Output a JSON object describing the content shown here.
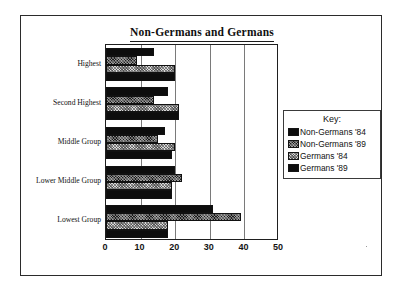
{
  "chart_data": {
    "type": "bar",
    "orientation": "horizontal",
    "title": "Non-Germans and Germans",
    "xlabel": "",
    "ylabel": "",
    "xlim": [
      0,
      50
    ],
    "xticks": [
      0,
      10,
      20,
      30,
      40,
      50
    ],
    "grid": "vertical",
    "legend_position": "right",
    "legend_title": "Key:",
    "categories": [
      "Highest",
      "Second Highest",
      "Middle Group",
      "Lower Middle Group",
      "Lowest Group"
    ],
    "series": [
      {
        "name": "Non-Germans '84",
        "swatch": "solid-black",
        "color": "#0d0d0d",
        "values": [
          14,
          18,
          17,
          20,
          31
        ]
      },
      {
        "name": "Non-Germans '89",
        "swatch": "dark-hatch",
        "color": "#1c1c1c",
        "values": [
          9,
          14,
          15,
          22,
          39
        ]
      },
      {
        "name": "Germans '84",
        "swatch": "light-check",
        "color": "#d9d9d9",
        "values": [
          20,
          21,
          20,
          19,
          18
        ]
      },
      {
        "name": "Germans '89",
        "swatch": "solid-black",
        "color": "#0d0d0d",
        "values": [
          20,
          21,
          19,
          19,
          18
        ]
      }
    ]
  }
}
